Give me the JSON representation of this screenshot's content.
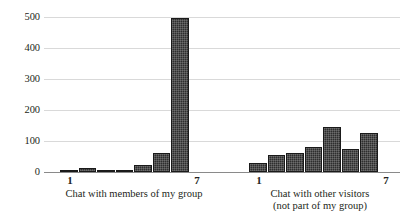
{
  "chart_data": {
    "type": "bar",
    "title": "",
    "xlabel": "",
    "ylabel": "",
    "ylim": [
      0,
      500
    ],
    "yticks": [
      0,
      100,
      200,
      300,
      400,
      500
    ],
    "ytick_labels": [
      "0",
      "100",
      "200",
      "300",
      "400",
      "500"
    ],
    "grid": true,
    "legend": "none",
    "orientation": "vertical",
    "bar_color": "#2e2e2e",
    "gridline_color": "#d9d9d9",
    "axis_color": "#8a8a8a",
    "groups": [
      {
        "name": "chat-with-members-of-my-group",
        "caption_line1": "Chat with members of my group",
        "caption_line2": "",
        "categories": [
          "1",
          "2",
          "3",
          "4",
          "5",
          "6",
          "7"
        ],
        "tick_labels_shown": [
          "1",
          "7"
        ],
        "values": [
          8,
          12,
          8,
          3,
          22,
          62,
          497
        ]
      },
      {
        "name": "chat-with-other-visitors",
        "caption_line1": "Chat with other visitors",
        "caption_line2": "(not part of my group)",
        "categories": [
          "1",
          "2",
          "3",
          "4",
          "5",
          "6",
          "7"
        ],
        "tick_labels_shown": [
          "1",
          "7"
        ],
        "values": [
          29,
          55,
          61,
          81,
          145,
          74,
          126
        ]
      }
    ]
  }
}
